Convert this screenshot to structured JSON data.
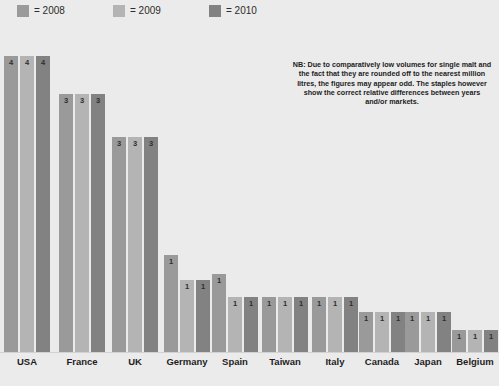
{
  "legend": {
    "items": [
      {
        "label": "= 2008",
        "color": "#9a9a9a",
        "year": "2008"
      },
      {
        "label": "= 2009",
        "color": "#b4b4b4",
        "year": "2009"
      },
      {
        "label": "= 2010",
        "color": "#828282",
        "year": "2010"
      }
    ]
  },
  "note": {
    "text": "NB: Due to comparatively low volumes for single malt and the fact that they are rounded off to the nearest million litres, the figures may appear odd. The staples however show the correct relative differences between years and/or markets."
  },
  "chart_data": {
    "type": "bar",
    "title": "",
    "xlabel": "",
    "ylabel": "",
    "ylim": [
      0,
      4.4
    ],
    "grid": false,
    "legend_position": "top-left",
    "categories": [
      "USA",
      "France",
      "UK",
      "Germany",
      "Spain",
      "Taiwan",
      "Italy",
      "Canada",
      "Japan",
      "Belgium"
    ],
    "series": [
      {
        "name": "2008",
        "color": "#9a9a9a",
        "values": [
          4,
          3,
          3,
          1,
          1,
          1,
          1,
          1,
          1,
          1
        ]
      },
      {
        "name": "2009",
        "color": "#b4b4b4",
        "values": [
          4,
          3,
          3,
          1,
          1,
          1,
          1,
          1,
          1,
          1
        ]
      },
      {
        "name": "2010",
        "color": "#828282",
        "values": [
          4,
          3,
          3,
          1,
          1,
          1,
          1,
          1,
          1,
          1
        ]
      }
    ],
    "bar_heights_px": {
      "USA": [
        296,
        296,
        296
      ],
      "France": [
        258,
        258,
        258
      ],
      "UK": [
        215,
        215,
        215
      ],
      "Germany": [
        97,
        72,
        72
      ],
      "Spain": [
        78,
        55,
        55
      ],
      "Taiwan": [
        55,
        55,
        55
      ],
      "Italy": [
        55,
        55,
        55
      ],
      "Canada": [
        40,
        40,
        40
      ],
      "Japan": [
        40,
        40,
        40
      ],
      "Belgium": [
        22,
        22,
        22
      ]
    },
    "bar_labels": {
      "USA": [
        "4",
        "4",
        "4"
      ],
      "France": [
        "3",
        "3",
        "3"
      ],
      "UK": [
        "3",
        "3",
        "3"
      ],
      "Germany": [
        "1",
        "1",
        "1"
      ],
      "Spain": [
        "1",
        "1",
        "1"
      ],
      "Taiwan": [
        "1",
        "1",
        "1"
      ],
      "Italy": [
        "1",
        "1",
        "1"
      ],
      "Canada": [
        "1",
        "1",
        "1"
      ],
      "Japan": [
        "1",
        "1",
        "1"
      ],
      "Belgium": [
        "1",
        "1",
        "1"
      ]
    },
    "group_left_px": [
      4,
      59,
      112,
      164,
      212,
      262,
      312,
      359,
      405,
      452
    ],
    "group_width_px": 46,
    "background_color": "#ebebeb",
    "baseline_color": "#d2d2d2"
  }
}
